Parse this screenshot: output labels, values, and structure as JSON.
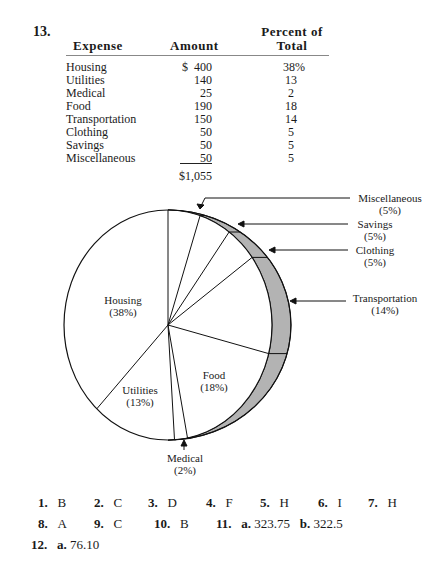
{
  "problem": {
    "number": "13."
  },
  "table": {
    "headers": {
      "expense": "Expense",
      "amount": "Amount",
      "percent_line1": "Percent of",
      "percent_line2": "Total"
    },
    "rows": [
      {
        "expense": "Housing",
        "amount": "$  400",
        "percent": "38%"
      },
      {
        "expense": "Utilities",
        "amount": "140",
        "percent": "13"
      },
      {
        "expense": "Medical",
        "amount": "25",
        "percent": "2"
      },
      {
        "expense": "Food",
        "amount": "190",
        "percent": "18"
      },
      {
        "expense": "Transportation",
        "amount": "150",
        "percent": "14"
      },
      {
        "expense": "Clothing",
        "amount": "50",
        "percent": "5"
      },
      {
        "expense": "Savings",
        "amount": "50",
        "percent": "5"
      },
      {
        "expense": "Miscellaneous",
        "amount": "50",
        "percent": "5"
      }
    ],
    "total": "$1,055"
  },
  "pie_labels": {
    "housing": {
      "name": "Housing",
      "pct": "(38%)"
    },
    "utilities": {
      "name": "Utilities",
      "pct": "(13%)"
    },
    "food": {
      "name": "Food",
      "pct": "(18%)"
    },
    "medical": {
      "name": "Medical",
      "pct": "(2%)"
    },
    "transportation": {
      "name": "Transportation",
      "pct": "(14%)"
    },
    "clothing": {
      "name": "Clothing",
      "pct": "(5%)"
    },
    "savings": {
      "name": "Savings",
      "pct": "(5%)"
    },
    "miscellaneous": {
      "name": "Miscellaneous",
      "pct": "(5%)"
    }
  },
  "answers": {
    "row1": [
      {
        "num": "1.",
        "val": "B"
      },
      {
        "num": "2.",
        "val": "C"
      },
      {
        "num": "3.",
        "val": "D"
      },
      {
        "num": "4.",
        "val": "F"
      },
      {
        "num": "5.",
        "val": "H"
      },
      {
        "num": "6.",
        "val": "I"
      },
      {
        "num": "7.",
        "val": "H"
      }
    ],
    "row2": [
      {
        "num": "8.",
        "val": "A"
      },
      {
        "num": "9.",
        "val": "C"
      },
      {
        "num": "10.",
        "val": "B"
      },
      {
        "num": "11.",
        "a": "a.",
        "aval": "323.75",
        "b": "b.",
        "bval": "322.5"
      }
    ],
    "row3": {
      "num": "12.",
      "a": "a.",
      "aval": "76.10"
    }
  },
  "chart_data": {
    "type": "pie",
    "title": "",
    "categories": [
      "Housing",
      "Utilities",
      "Medical",
      "Food",
      "Transportation",
      "Clothing",
      "Savings",
      "Miscellaneous"
    ],
    "values": [
      38,
      13,
      2,
      18,
      14,
      5,
      5,
      5
    ],
    "amounts": [
      400,
      140,
      25,
      190,
      150,
      50,
      50,
      50
    ],
    "total_amount": 1055,
    "unit": "percent",
    "legend_position": "callouts right/bottom"
  }
}
